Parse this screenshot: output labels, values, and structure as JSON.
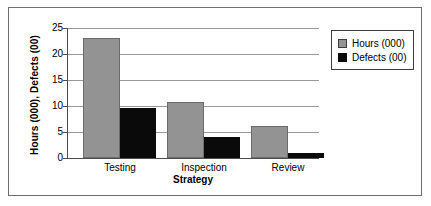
{
  "chart_data": {
    "type": "bar",
    "title": "",
    "categories": [
      "Testing",
      "Inspection",
      "Review"
    ],
    "series": [
      {
        "name": "Hours (000)",
        "color": "#939393",
        "values": [
          23.0,
          10.7,
          6.2
        ]
      },
      {
        "name": "Defects (00)",
        "color": "#0a0a0a",
        "values": [
          9.6,
          4.1,
          1.0
        ]
      }
    ],
    "xlabel": "Strategy",
    "ylabel": "Hours (000), Defects (00)",
    "ylim": [
      0,
      25
    ],
    "yticks": [
      0,
      5,
      10,
      15,
      20,
      25
    ],
    "ytick_labels": [
      "0",
      "5",
      "10",
      "15",
      "20",
      "25"
    ],
    "grid": true,
    "legend_position": "top-right"
  },
  "axes": {
    "y_title": "Hours (000), Defects (00)",
    "x_title": "Strategy"
  },
  "ticks": {
    "t0": "0",
    "t5": "5",
    "t10": "10",
    "t15": "15",
    "t20": "20",
    "t25": "25"
  },
  "categories": {
    "c0": "Testing",
    "c1": "Inspection",
    "c2": "Review"
  },
  "legend": {
    "items": [
      {
        "label": "Hours (000)"
      },
      {
        "label": "Defects (00)"
      }
    ]
  },
  "colors": {
    "hours": "#939393",
    "defects": "#0a0a0a",
    "gridline": "#9a9a9a",
    "axis": "#4d4d4d",
    "frame": "#6e6e6e"
  }
}
